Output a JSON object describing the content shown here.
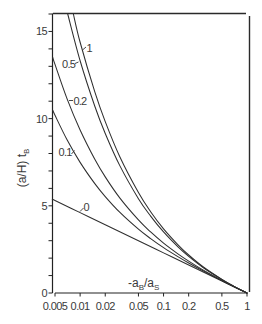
{
  "figure": {
    "background": "#ffffff",
    "ink_color": "#2f2f2f"
  },
  "chart_data": {
    "type": "line",
    "title": "",
    "xlabel": "-a_B/a_S",
    "xlabel_parts": [
      {
        "t": "-a",
        "sub": false
      },
      {
        "t": "B",
        "sub": true
      },
      {
        "t": "/a",
        "sub": false
      },
      {
        "t": "S",
        "sub": true
      }
    ],
    "ylabel": "(a/H) t_B",
    "ylabel_parts": [
      {
        "t": "(a/H) t",
        "sub": false
      },
      {
        "t": "B",
        "sub": true
      }
    ],
    "xscale": "log",
    "yscale": "linear",
    "xlim": [
      0.005,
      1
    ],
    "ylim": [
      0,
      16
    ],
    "xticks": [
      0.005,
      0.01,
      0.02,
      0.05,
      0.1,
      0.2,
      0.5,
      1
    ],
    "xtick_labels": [
      "0.005",
      "0.01",
      "0.02",
      "0.05",
      "0.1",
      "0.2",
      "0.5",
      "1"
    ],
    "yticks": [
      0,
      5,
      10,
      15
    ],
    "ytick_labels": [
      "0",
      "5",
      "10",
      "15"
    ],
    "yminor_ticks": [
      0,
      1,
      2,
      3,
      4,
      5,
      6,
      7,
      8,
      9,
      10,
      11,
      12,
      13,
      14,
      15,
      16
    ],
    "grid": false,
    "legend": "none (curves labeled inline)",
    "series": [
      {
        "name": "0",
        "label": "0",
        "points": [
          [
            0.0047,
            5.36
          ],
          [
            0.005,
            5.3
          ],
          [
            0.01,
            4.61
          ],
          [
            0.02,
            3.91
          ],
          [
            0.05,
            3.0
          ],
          [
            0.1,
            2.3
          ],
          [
            0.2,
            1.61
          ],
          [
            0.5,
            0.69
          ],
          [
            1,
            0
          ]
        ]
      },
      {
        "name": "0.1",
        "label": "0.1",
        "points": [
          [
            0.0047,
            10.48
          ],
          [
            0.005,
            10.19
          ],
          [
            0.007,
            8.77
          ],
          [
            0.01,
            7.49
          ],
          [
            0.015,
            6.27
          ],
          [
            0.02,
            5.53
          ],
          [
            0.03,
            4.62
          ],
          [
            0.05,
            3.66
          ],
          [
            0.07,
            3.12
          ],
          [
            0.1,
            2.6
          ],
          [
            0.15,
            2.07
          ],
          [
            0.2,
            1.72
          ],
          [
            0.3,
            1.26
          ],
          [
            0.5,
            0.71
          ],
          [
            0.7,
            0.36
          ],
          [
            1,
            0
          ]
        ]
      },
      {
        "name": "0.2",
        "label": "0.2",
        "points": [
          [
            0.0047,
            13.51
          ],
          [
            0.005,
            13.11
          ],
          [
            0.007,
            11.12
          ],
          [
            0.01,
            9.35
          ],
          [
            0.015,
            7.67
          ],
          [
            0.02,
            6.66
          ],
          [
            0.03,
            5.44
          ],
          [
            0.05,
            4.19
          ],
          [
            0.07,
            3.5
          ],
          [
            0.1,
            2.86
          ],
          [
            0.15,
            2.23
          ],
          [
            0.2,
            1.83
          ],
          [
            0.3,
            1.31
          ],
          [
            0.5,
            0.72
          ],
          [
            0.7,
            0.36
          ],
          [
            1,
            0
          ]
        ]
      },
      {
        "name": "0.5",
        "label": "0.5",
        "points": [
          [
            0.0071,
            16.0
          ],
          [
            0.01,
            13.32
          ],
          [
            0.015,
            10.71
          ],
          [
            0.02,
            9.15
          ],
          [
            0.03,
            7.29
          ],
          [
            0.05,
            5.41
          ],
          [
            0.07,
            4.41
          ],
          [
            0.1,
            3.5
          ],
          [
            0.15,
            2.63
          ],
          [
            0.2,
            2.1
          ],
          [
            0.3,
            1.45
          ],
          [
            0.5,
            0.77
          ],
          [
            0.7,
            0.37
          ],
          [
            1,
            0
          ]
        ]
      },
      {
        "name": "1",
        "label": "1",
        "points": [
          [
            0.0083,
            16.0
          ],
          [
            0.01,
            14.38
          ],
          [
            0.015,
            11.53
          ],
          [
            0.02,
            9.83
          ],
          [
            0.03,
            7.8
          ],
          [
            0.05,
            5.76
          ],
          [
            0.07,
            4.66
          ],
          [
            0.1,
            3.68
          ],
          [
            0.15,
            2.75
          ],
          [
            0.2,
            2.18
          ],
          [
            0.3,
            1.49
          ],
          [
            0.5,
            0.78
          ],
          [
            0.7,
            0.38
          ],
          [
            1,
            0
          ]
        ]
      }
    ]
  }
}
